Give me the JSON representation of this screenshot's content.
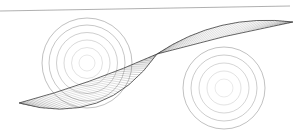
{
  "figure": {
    "title": "",
    "width": 298,
    "height": 134,
    "background_color": "#ffffff"
  },
  "chart_data": {
    "type": "line",
    "title": "",
    "subtitle": "",
    "xlabel": "",
    "ylabel": "",
    "grid": false,
    "legend_position": "none",
    "xlim": [
      0,
      298
    ],
    "ylim": [
      0,
      134
    ],
    "axis_visible": false,
    "tick_labels": {
      "x": [],
      "y": []
    },
    "annotations": [],
    "series": [
      {
        "name": "top-rule-line",
        "kind": "straight-line",
        "color": "#8a8a8a",
        "width": 0.8,
        "x": [
          0,
          290
        ],
        "y": [
          11,
          6
        ]
      },
      {
        "name": "left-concentric-circles",
        "kind": "concentric-circles",
        "color": "#9a9a9a",
        "width": 0.7,
        "center": [
          87,
          63
        ],
        "radii": [
          8,
          15.5,
          23,
          30.5,
          38,
          45
        ],
        "opacities": [
          0.32,
          0.42,
          0.55,
          0.68,
          0.8,
          0.9
        ]
      },
      {
        "name": "right-concentric-circles",
        "kind": "concentric-circles",
        "color": "#9a9a9a",
        "width": 0.7,
        "center": [
          224,
          88
        ],
        "radii": [
          9,
          17,
          25,
          33,
          41
        ],
        "opacities": [
          0.3,
          0.42,
          0.58,
          0.72,
          0.88
        ]
      },
      {
        "name": "lower-left-lens-envelope",
        "kind": "ruled-lens",
        "color": "#2a2a2a",
        "width": 0.55,
        "line_count": 44,
        "chord_start": [
          19,
          103
        ],
        "chord_end": [
          157,
          54
        ],
        "arc_sag": 26,
        "spine_sag": 3
      },
      {
        "name": "upper-right-lens-envelope",
        "kind": "ruled-lens",
        "color": "#2a2a2a",
        "width": 0.55,
        "line_count": 40,
        "chord_start": [
          157,
          54
        ],
        "chord_end": [
          293,
          22
        ],
        "arc_sag": -13,
        "spine_sag": -1.5
      }
    ]
  }
}
